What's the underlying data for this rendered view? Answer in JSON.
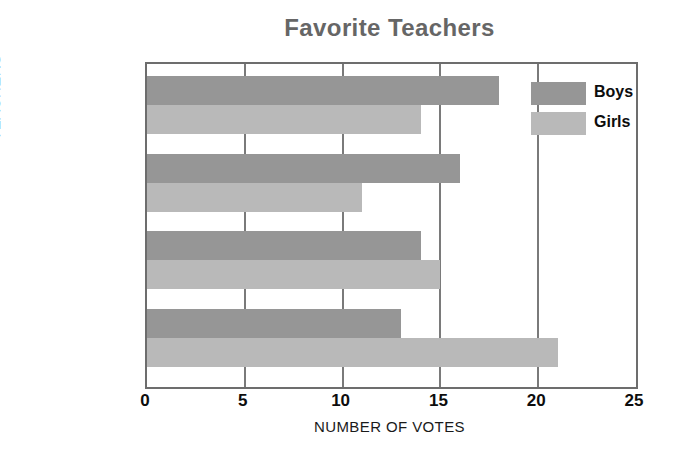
{
  "chart_data": {
    "type": "bar",
    "orientation": "horizontal",
    "title": "Favorite Teachers",
    "xlabel": "NUMBER OF VOTES",
    "ylabel": "TEACHERS",
    "categories": [
      "Nichols",
      "Davis",
      "Tallchief",
      "Torres"
    ],
    "series": [
      {
        "name": "Boys",
        "color": "#969696",
        "values": [
          18,
          16,
          14,
          13
        ]
      },
      {
        "name": "Girls",
        "color": "#b9b9b9",
        "values": [
          14,
          11,
          15,
          21
        ]
      }
    ],
    "xlim": [
      0,
      25
    ],
    "xticks": [
      "0",
      "5",
      "10",
      "15",
      "20",
      "25"
    ],
    "xtick_values": [
      0,
      5,
      10,
      15,
      20,
      25
    ],
    "grid": "vertical",
    "legend_position": "inside-top-right"
  },
  "legend": {
    "items": [
      {
        "label": "Boys",
        "color": "#969696"
      },
      {
        "label": "Girls",
        "color": "#b9b9b9"
      }
    ]
  },
  "colors": {
    "title": "#666666",
    "frame": "#6d6d6d",
    "gridline": "#7a7a7a",
    "boys": "#969696",
    "girls": "#b9b9b9",
    "text": "#0d0d0d"
  }
}
